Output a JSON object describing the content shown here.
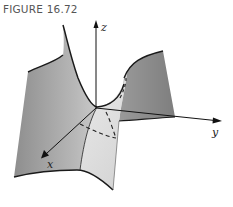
{
  "figure": {
    "caption": "FIGURE 16.72"
  },
  "axes": {
    "x_label": "x",
    "y_label": "y",
    "z_label": "z"
  },
  "colors": {
    "background": "#ffffff",
    "surface_dark": "#8c8c8c",
    "surface_mid": "#b4b4b4",
    "surface_light": "#e6e6e6",
    "edge": "#1a1a1a",
    "caption": "#555555"
  }
}
